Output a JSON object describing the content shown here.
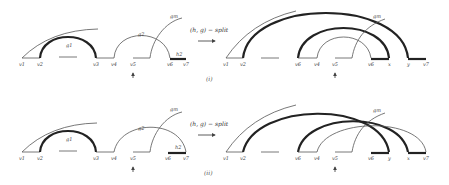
{
  "panels": [
    {
      "caption": "(i)",
      "operation": "(h, g) − split",
      "before": {
        "vertices": [
          "v1",
          "v2",
          "v3",
          "v4",
          "v5",
          "v6",
          "v7"
        ],
        "arc_labels": {
          "g1": "g1",
          "g2": "g2",
          "gm": "gm",
          "h": "h2"
        }
      },
      "after": {
        "vertices": [
          "v1",
          "v2",
          "v6",
          "v4",
          "v5",
          "v6",
          "x",
          "y",
          "v7"
        ],
        "arc_labels": {
          "gm": "gm"
        }
      }
    },
    {
      "caption": "(ii)",
      "operation": "(h, g) − split",
      "before": {
        "vertices": [
          "v1",
          "v2",
          "v3",
          "v4",
          "v5",
          "v6",
          "v7"
        ],
        "arc_labels": {
          "g1": "g1",
          "g2": "g2",
          "gm": "gm",
          "h": "h2"
        }
      },
      "after": {
        "vertices": [
          "v1",
          "v2",
          "v6",
          "v4",
          "v5",
          "v6",
          "y",
          "x",
          "v7"
        ],
        "arc_labels": {
          "gm": "gm"
        }
      }
    }
  ]
}
